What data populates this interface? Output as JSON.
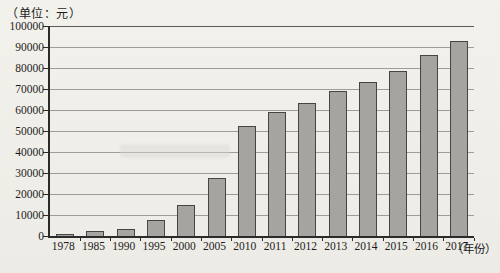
{
  "unit_label": "（单位：元）",
  "x_axis_suffix": "（年份）",
  "chart_data": {
    "type": "bar",
    "title": "",
    "xlabel": "（年份）",
    "ylabel": "（单位：元）",
    "categories": [
      "1978",
      "1985",
      "1990",
      "1995",
      "2000",
      "2005",
      "2010",
      "2011",
      "2012",
      "2013",
      "2014",
      "2015",
      "2016",
      "2017"
    ],
    "values": [
      1000,
      2600,
      3300,
      7500,
      15000,
      27500,
      52500,
      59000,
      63500,
      69000,
      73500,
      78500,
      86000,
      93000
    ],
    "ylim": [
      0,
      100000
    ],
    "ytick_step": 10000,
    "yticks": [
      0,
      10000,
      20000,
      30000,
      40000,
      50000,
      60000,
      70000,
      80000,
      90000,
      100000
    ],
    "grid": true,
    "legend": "none",
    "bar_fill_color": "#a5a4a1",
    "bar_border_color": "#454543",
    "gridline_color": "#9d9c98",
    "axis_color": "#2b2b2b",
    "background_color": "#f2f0eb"
  }
}
